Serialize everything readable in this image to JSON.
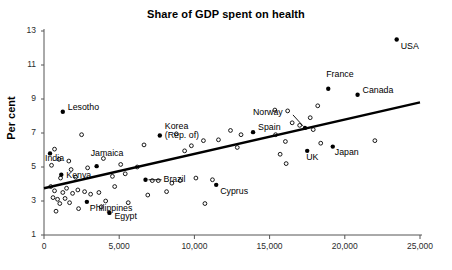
{
  "chart_data": {
    "type": "scatter",
    "title": "Share of GDP spent on health",
    "xlabel": "",
    "ylabel": "Per cent",
    "xlim": [
      0,
      25000
    ],
    "ylim": [
      1,
      13
    ],
    "grid": false,
    "legend": "none",
    "x_ticks": [
      0,
      5000,
      10000,
      15000,
      20000,
      25000
    ],
    "x_tick_labels": [
      "0",
      "5,000",
      "10,000",
      "15,000",
      "20,000",
      "25,000"
    ],
    "y_ticks": [
      1,
      3,
      5,
      7,
      9,
      11,
      13
    ],
    "y_tick_labels": [
      "1",
      "3",
      "5",
      "7",
      "9",
      "11",
      "13"
    ],
    "trendline": {
      "x": [
        0,
        25000
      ],
      "y": [
        3.75,
        8.8
      ]
    },
    "labeled_points": [
      {
        "label": "USA",
        "x": 23450,
        "y": 12.5,
        "label_dx": 4,
        "label_dy": 7
      },
      {
        "label": "Lesotho",
        "x": 1250,
        "y": 8.25,
        "label_dx": 5,
        "label_dy": -4
      },
      {
        "label": "France",
        "x": 18900,
        "y": 9.6,
        "label_dx": -2,
        "label_dy": -14
      },
      {
        "label": "Canada",
        "x": 20850,
        "y": 9.25,
        "label_dx": 5,
        "label_dy": -4
      },
      {
        "label": "Norway",
        "x": 17350,
        "y": 7.3,
        "label_dx": -52,
        "label_dy": -15
      },
      {
        "label": "Spain",
        "x": 13900,
        "y": 7.05,
        "label_dx": 5,
        "label_dy": -4
      },
      {
        "label": "Japan",
        "x": 19200,
        "y": 6.2,
        "label_dx": 2,
        "label_dy": 6
      },
      {
        "label": "UK",
        "x": 17500,
        "y": 5.95,
        "label_dx": -1,
        "label_dy": 7
      },
      {
        "label": "Korea\n(Rep. of)",
        "x": 7700,
        "y": 6.85,
        "label_dx": 5,
        "label_dy": -4
      },
      {
        "label": "India",
        "x": 400,
        "y": 5.8,
        "label_dx": -5,
        "label_dy": 6
      },
      {
        "label": "Jamaica",
        "x": 3500,
        "y": 5.05,
        "label_dx": -6,
        "label_dy": -12
      },
      {
        "label": "Kenya",
        "x": 1150,
        "y": 4.55,
        "label_dx": 5,
        "label_dy": 1
      },
      {
        "label": "Brazil",
        "x": 6750,
        "y": 4.25,
        "label_dx": 18,
        "label_dy": 0
      },
      {
        "label": "Cyprus",
        "x": 11450,
        "y": 3.95,
        "label_dx": 4,
        "label_dy": 7
      },
      {
        "label": "Philippines",
        "x": 2850,
        "y": 2.95,
        "label_dx": 3,
        "label_dy": 7
      },
      {
        "label": "Egypt",
        "x": 4350,
        "y": 2.3,
        "label_dx": 5,
        "label_dy": 4
      }
    ],
    "unlabeled_points": [
      {
        "x": 2500,
        "y": 6.9
      },
      {
        "x": 8800,
        "y": 6.95
      },
      {
        "x": 10600,
        "y": 6.55
      },
      {
        "x": 6650,
        "y": 6.3
      },
      {
        "x": 11600,
        "y": 6.6
      },
      {
        "x": 15400,
        "y": 6.9
      },
      {
        "x": 9350,
        "y": 5.95
      },
      {
        "x": 9800,
        "y": 6.25
      },
      {
        "x": 16500,
        "y": 7.6
      },
      {
        "x": 17700,
        "y": 7.9
      },
      {
        "x": 17000,
        "y": 7.45
      },
      {
        "x": 17900,
        "y": 7.2
      },
      {
        "x": 16200,
        "y": 8.3
      },
      {
        "x": 15350,
        "y": 8.35
      },
      {
        "x": 18200,
        "y": 8.6
      },
      {
        "x": 13100,
        "y": 6.9
      },
      {
        "x": 12850,
        "y": 6.15
      },
      {
        "x": 16050,
        "y": 6.5
      },
      {
        "x": 22000,
        "y": 6.55
      },
      {
        "x": 12400,
        "y": 7.15
      },
      {
        "x": 18400,
        "y": 6.4
      },
      {
        "x": 15700,
        "y": 5.75
      },
      {
        "x": 16100,
        "y": 5.2
      },
      {
        "x": 700,
        "y": 6.05
      },
      {
        "x": 1000,
        "y": 5.45
      },
      {
        "x": 1650,
        "y": 5.35
      },
      {
        "x": 500,
        "y": 5.1
      },
      {
        "x": 1800,
        "y": 4.85
      },
      {
        "x": 1100,
        "y": 4.35
      },
      {
        "x": 2100,
        "y": 4.4
      },
      {
        "x": 3950,
        "y": 5.5
      },
      {
        "x": 5100,
        "y": 5.15
      },
      {
        "x": 5400,
        "y": 4.6
      },
      {
        "x": 4550,
        "y": 4.45
      },
      {
        "x": 7200,
        "y": 4.2
      },
      {
        "x": 7600,
        "y": 4.2
      },
      {
        "x": 8500,
        "y": 4.05
      },
      {
        "x": 9050,
        "y": 4.2
      },
      {
        "x": 10100,
        "y": 4.35
      },
      {
        "x": 11200,
        "y": 4.25
      },
      {
        "x": 8150,
        "y": 3.55
      },
      {
        "x": 10700,
        "y": 2.85
      },
      {
        "x": 450,
        "y": 3.85
      },
      {
        "x": 700,
        "y": 3.6
      },
      {
        "x": 1250,
        "y": 3.5
      },
      {
        "x": 1500,
        "y": 3.75
      },
      {
        "x": 1900,
        "y": 3.45
      },
      {
        "x": 2250,
        "y": 3.65
      },
      {
        "x": 2700,
        "y": 3.55
      },
      {
        "x": 3100,
        "y": 3.4
      },
      {
        "x": 3650,
        "y": 3.5
      },
      {
        "x": 600,
        "y": 3.2
      },
      {
        "x": 900,
        "y": 3.1
      },
      {
        "x": 1400,
        "y": 3.15
      },
      {
        "x": 1050,
        "y": 2.85
      },
      {
        "x": 1700,
        "y": 2.9
      },
      {
        "x": 2300,
        "y": 2.55
      },
      {
        "x": 800,
        "y": 2.4
      },
      {
        "x": 3800,
        "y": 2.65
      },
      {
        "x": 5600,
        "y": 2.9
      },
      {
        "x": 4100,
        "y": 3.0
      },
      {
        "x": 6200,
        "y": 5.0
      },
      {
        "x": 4700,
        "y": 3.85
      },
      {
        "x": 6900,
        "y": 3.35
      },
      {
        "x": 2900,
        "y": 4.95
      }
    ]
  }
}
